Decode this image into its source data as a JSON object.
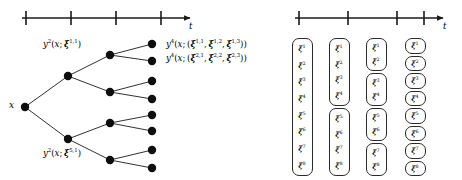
{
  "figure": {
    "kind": "scenario-tree-and-scenario-bundle-diagram",
    "background_color": "#ffffff",
    "ink_color": "#000000"
  },
  "left_panel": {
    "axis": {
      "label": "t",
      "tick_count": 4,
      "has_arrow": true,
      "x_start": 22,
      "x_end": 196,
      "y": 18,
      "tick_x": [
        26,
        71,
        116,
        161
      ]
    },
    "root_label": "x",
    "stage_labels": [
      {
        "id": "stage2-upper",
        "text": "y²(x; ξ¹¹)",
        "y_base": "y",
        "y_sup": "2",
        "arg": "x",
        "xi_sup": "1,1"
      },
      {
        "id": "stage2-lower",
        "text": "y²(x; ξ⁵¹)",
        "y_base": "y",
        "y_sup": "2",
        "arg": "x",
        "xi_sup": "5,1"
      }
    ],
    "leaf_labels": [
      {
        "id": "leaf-upper",
        "y_sup": "4",
        "arg": "x",
        "xi_sups": [
          "1,1",
          "1,2",
          "1,3"
        ]
      },
      {
        "id": "leaf-lower",
        "y_sup": "4",
        "arg": "x",
        "xi_sups": [
          "2,1",
          "2,2",
          "2,3"
        ]
      }
    ],
    "tree": {
      "node_radius": 4.0,
      "root": {
        "x": 25,
        "y": 107
      },
      "stage2": [
        {
          "x": 68,
          "y": 76
        },
        {
          "x": 68,
          "y": 139
        }
      ],
      "stage3": [
        {
          "x": 110,
          "y": 55
        },
        {
          "x": 110,
          "y": 92
        },
        {
          "x": 110,
          "y": 123
        },
        {
          "x": 110,
          "y": 160
        }
      ],
      "stage4": [
        {
          "x": 152,
          "y": 44
        },
        {
          "x": 152,
          "y": 61
        },
        {
          "x": 152,
          "y": 81
        },
        {
          "x": 152,
          "y": 99
        },
        {
          "x": 152,
          "y": 115
        },
        {
          "x": 152,
          "y": 131
        },
        {
          "x": 152,
          "y": 150
        },
        {
          "x": 152,
          "y": 168
        }
      ]
    }
  },
  "right_panel": {
    "axis": {
      "label": "t",
      "tick_count": 4,
      "has_arrow": true,
      "x_start": 295,
      "x_end": 448,
      "y": 18,
      "tick_x": [
        299,
        348,
        397,
        424
      ]
    },
    "columns": [
      {
        "id": "column-stage-1",
        "center_x": 302,
        "boxes": [
          {
            "items": [
              "1",
              "2",
              "3",
              "4",
              "5",
              "6",
              "7",
              "8"
            ]
          }
        ]
      },
      {
        "id": "column-stage-2",
        "center_x": 339,
        "boxes": [
          {
            "items": [
              "1",
              "2",
              "3",
              "4"
            ]
          },
          {
            "items": [
              "5",
              "6",
              "7",
              "8"
            ]
          }
        ]
      },
      {
        "id": "column-stage-3",
        "center_x": 376,
        "boxes": [
          {
            "items": [
              "1",
              "2"
            ]
          },
          {
            "items": [
              "3",
              "4"
            ]
          },
          {
            "items": [
              "5",
              "6"
            ]
          },
          {
            "items": [
              "7",
              "8"
            ]
          }
        ]
      },
      {
        "id": "column-stage-4",
        "center_x": 415,
        "boxes": [
          {
            "items": [
              "1"
            ]
          },
          {
            "items": [
              "2"
            ]
          },
          {
            "items": [
              "3"
            ]
          },
          {
            "items": [
              "4"
            ]
          },
          {
            "items": [
              "5"
            ]
          },
          {
            "items": [
              "6"
            ]
          },
          {
            "items": [
              "7"
            ]
          },
          {
            "items": [
              "8"
            ]
          }
        ]
      }
    ],
    "symbol": "ξ"
  }
}
